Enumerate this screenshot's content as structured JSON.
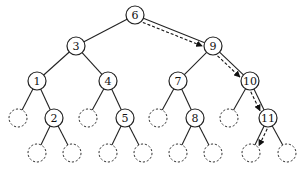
{
  "diagram": {
    "type": "binary-search-tree",
    "nodes": [
      {
        "id": "n6",
        "label": "6",
        "x": 135,
        "y": 15,
        "kind": "key"
      },
      {
        "id": "n3",
        "label": "3",
        "x": 76,
        "y": 46,
        "kind": "key"
      },
      {
        "id": "n9",
        "label": "9",
        "x": 213,
        "y": 46,
        "kind": "key"
      },
      {
        "id": "n1",
        "label": "1",
        "x": 37,
        "y": 81,
        "kind": "key"
      },
      {
        "id": "n4",
        "label": "4",
        "x": 108,
        "y": 81,
        "kind": "key"
      },
      {
        "id": "n7",
        "label": "7",
        "x": 178,
        "y": 81,
        "kind": "key"
      },
      {
        "id": "n10",
        "label": "10",
        "x": 250,
        "y": 81,
        "kind": "key"
      },
      {
        "id": "e1l",
        "label": "",
        "x": 18,
        "y": 118,
        "kind": "nil"
      },
      {
        "id": "n2",
        "label": "2",
        "x": 54,
        "y": 118,
        "kind": "key"
      },
      {
        "id": "e4l",
        "label": "",
        "x": 88,
        "y": 118,
        "kind": "nil"
      },
      {
        "id": "n5",
        "label": "5",
        "x": 125,
        "y": 118,
        "kind": "key"
      },
      {
        "id": "e7l",
        "label": "",
        "x": 158,
        "y": 118,
        "kind": "nil"
      },
      {
        "id": "n8",
        "label": "8",
        "x": 195,
        "y": 118,
        "kind": "key"
      },
      {
        "id": "e10l",
        "label": "",
        "x": 229,
        "y": 118,
        "kind": "nil"
      },
      {
        "id": "n11",
        "label": "11",
        "x": 268,
        "y": 118,
        "kind": "key"
      },
      {
        "id": "e2l",
        "label": "",
        "x": 37,
        "y": 153,
        "kind": "nil"
      },
      {
        "id": "e2r",
        "label": "",
        "x": 72,
        "y": 153,
        "kind": "nil"
      },
      {
        "id": "e5l",
        "label": "",
        "x": 108,
        "y": 153,
        "kind": "nil"
      },
      {
        "id": "e5r",
        "label": "",
        "x": 143,
        "y": 153,
        "kind": "nil"
      },
      {
        "id": "e8l",
        "label": "",
        "x": 178,
        "y": 153,
        "kind": "nil"
      },
      {
        "id": "e8r",
        "label": "",
        "x": 213,
        "y": 153,
        "kind": "nil"
      },
      {
        "id": "e11l",
        "label": "",
        "x": 251,
        "y": 153,
        "kind": "nil"
      },
      {
        "id": "e11r",
        "label": "",
        "x": 287,
        "y": 153,
        "kind": "nil"
      }
    ],
    "edges": [
      [
        "n6",
        "n3"
      ],
      [
        "n6",
        "n9"
      ],
      [
        "n3",
        "n1"
      ],
      [
        "n3",
        "n4"
      ],
      [
        "n9",
        "n7"
      ],
      [
        "n9",
        "n10"
      ],
      [
        "n1",
        "e1l"
      ],
      [
        "n1",
        "n2"
      ],
      [
        "n4",
        "e4l"
      ],
      [
        "n4",
        "n5"
      ],
      [
        "n7",
        "e7l"
      ],
      [
        "n7",
        "n8"
      ],
      [
        "n10",
        "e10l"
      ],
      [
        "n10",
        "n11"
      ],
      [
        "n2",
        "e2l"
      ],
      [
        "n2",
        "e2r"
      ],
      [
        "n5",
        "e5l"
      ],
      [
        "n5",
        "e5r"
      ],
      [
        "n8",
        "e8l"
      ],
      [
        "n8",
        "e8r"
      ],
      [
        "n11",
        "e11l"
      ],
      [
        "n11",
        "e11r"
      ]
    ],
    "search_path": [
      "n6",
      "n9",
      "n10",
      "n11",
      "e11l"
    ],
    "node_radius": 9
  }
}
